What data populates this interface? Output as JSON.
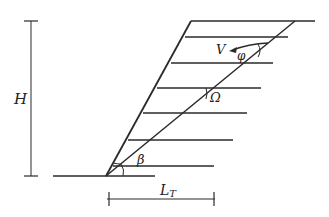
{
  "diagram": {
    "labels": {
      "height": "H",
      "velocity": "V",
      "phi": "φ",
      "omega": "Ω",
      "beta": "β",
      "length_main": "L",
      "length_sub": "T"
    },
    "colors": {
      "ink": "#2a2a2a",
      "background": "#ffffff"
    }
  }
}
